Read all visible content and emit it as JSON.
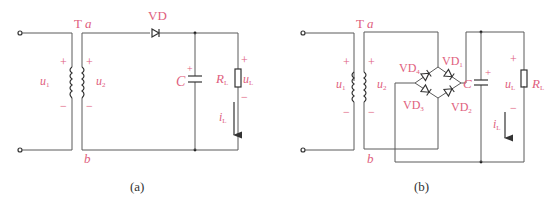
{
  "diagram_a": {
    "caption": "(a)",
    "transformer_label": "T",
    "node_a": "a",
    "node_b": "b",
    "primary_voltage": "u",
    "primary_voltage_sub": "1",
    "secondary_voltage": "u",
    "secondary_voltage_sub": "2",
    "diode_label": "VD",
    "capacitor_label": "C",
    "resistor_label": "R",
    "resistor_label_sub": "L",
    "load_voltage": "u",
    "load_voltage_sub": "L",
    "load_current": "i",
    "load_current_sub": "L",
    "plus": "+",
    "minus": "−"
  },
  "diagram_b": {
    "caption": "(b)",
    "transformer_label": "T",
    "node_a": "a",
    "node_b": "b",
    "primary_voltage": "u",
    "primary_voltage_sub": "1",
    "secondary_voltage": "u",
    "secondary_voltage_sub": "2",
    "diode_1": "VD",
    "diode_1_sub": "1",
    "diode_2": "VD",
    "diode_2_sub": "2",
    "diode_3": "VD",
    "diode_3_sub": "3",
    "diode_4": "VD",
    "diode_4_sub": "4",
    "capacitor_label": "C",
    "resistor_label": "R",
    "resistor_label_sub": "L",
    "load_voltage": "u",
    "load_voltage_sub": "L",
    "load_current": "i",
    "load_current_sub": "L",
    "plus": "+",
    "minus": "−"
  },
  "colors": {
    "label": "#e0607e",
    "wire": "#5a5a5a",
    "component": "#333333"
  }
}
